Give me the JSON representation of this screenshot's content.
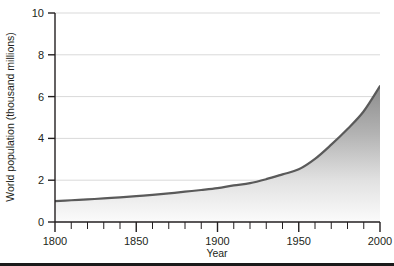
{
  "figure": {
    "background_color": "#ffffff",
    "axis_color": "#231f20",
    "grid_color": "#d9d9d9",
    "curve_color": "#5a5a5a",
    "fill_top_color": "#8c8c8c",
    "fill_bottom_color": "#fafafa",
    "bottom_rule_color": "#1a1a1a"
  },
  "chart_data": {
    "type": "area",
    "title": "",
    "xlabel": "Year",
    "ylabel": "World population (thousand millions)",
    "xlim": [
      1800,
      2000
    ],
    "ylim": [
      0,
      10
    ],
    "grid": true,
    "legend": "none",
    "xticks": [
      1800,
      1850,
      1900,
      1950,
      2000
    ],
    "xtick_labels": [
      "1800",
      "1850",
      "1900",
      "1950",
      "2000"
    ],
    "xminor_step": 10,
    "yticks": [
      0,
      2,
      4,
      6,
      8,
      10
    ],
    "ytick_labels": [
      "0",
      "2",
      "4",
      "6",
      "8",
      "10"
    ],
    "x": [
      1800,
      1810,
      1820,
      1830,
      1840,
      1850,
      1860,
      1870,
      1880,
      1890,
      1900,
      1910,
      1920,
      1930,
      1940,
      1950,
      1960,
      1970,
      1980,
      1990,
      2000
    ],
    "values": [
      1.0,
      1.04,
      1.08,
      1.13,
      1.18,
      1.24,
      1.3,
      1.37,
      1.45,
      1.53,
      1.62,
      1.75,
      1.86,
      2.05,
      2.28,
      2.52,
      3.02,
      3.7,
      4.45,
      5.3,
      6.5
    ],
    "series": [
      {
        "name": "World population",
        "values": [
          1.0,
          1.04,
          1.08,
          1.13,
          1.18,
          1.24,
          1.3,
          1.37,
          1.45,
          1.53,
          1.62,
          1.75,
          1.86,
          2.05,
          2.28,
          2.52,
          3.02,
          3.7,
          4.45,
          5.3,
          6.5
        ]
      }
    ]
  }
}
